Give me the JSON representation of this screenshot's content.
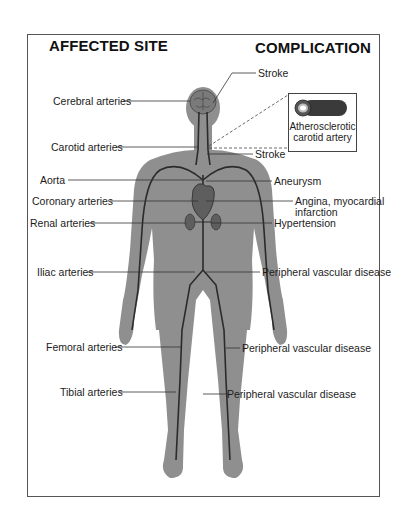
{
  "headers": {
    "left": "AFFECTED SITE",
    "right": "COMPLICATION"
  },
  "sites": [
    {
      "label": "Cerebral arteries"
    },
    {
      "label": "Carotid arteries"
    },
    {
      "label": "Aorta"
    },
    {
      "label": "Coronary arteries"
    },
    {
      "label": "Renal arteries"
    },
    {
      "label": "Iliac arteries"
    },
    {
      "label": "Femoral arteries"
    },
    {
      "label": "Tibial arteries"
    }
  ],
  "complications": [
    {
      "label": "Stroke"
    },
    {
      "label": "Stroke"
    },
    {
      "label": "Aneurysm"
    },
    {
      "label": "Angina, myocardial",
      "label2": "infarction"
    },
    {
      "label": "Hypertension"
    },
    {
      "label": "Peripheral vascular disease"
    },
    {
      "label": "Peripheral vascular disease"
    },
    {
      "label": "Peripheral vascular disease"
    }
  ],
  "inset": {
    "caption_line1": "Atherosclerotic",
    "caption_line2": "carotid artery",
    "icon": "artery-cross-section-icon"
  },
  "colors": {
    "body": "#8f8f8f",
    "vessel": "#2b2b2b",
    "organ": "#5e5e5e",
    "frame": "#555555"
  }
}
